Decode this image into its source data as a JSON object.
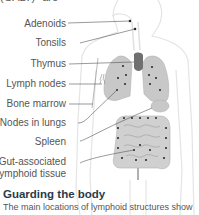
{
  "intro_fragment": "(GALT)\" are",
  "labels": [
    {
      "text": "Adenoids"
    },
    {
      "text": "Tonsils"
    },
    {
      "text": "Thymus"
    },
    {
      "text": "Lymph nodes"
    },
    {
      "text": "Bone marrow"
    },
    {
      "text": "Nodes in lungs"
    },
    {
      "text": "Spleen"
    },
    {
      "text": "Gut-associated"
    },
    {
      "text": "lymphoid tissue"
    }
  ],
  "caption": {
    "title": "Guarding the body",
    "text": "The main locations of lymphoid structures show"
  },
  "colors": {
    "organ_fill": "#c8c8c8",
    "thymus": "#707070",
    "body_outline": "#e6e6e6",
    "leader_line": "#555555",
    "caption_title": "#2a3a4a"
  }
}
